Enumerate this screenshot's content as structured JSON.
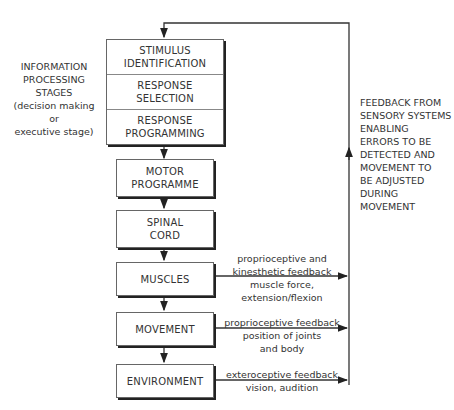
{
  "diagram": {
    "left_label": "INFORMATION\nPROCESSING\nSTAGES\n(decision making\nor\nexecutive stage)",
    "right_label": "FEEDBACK FROM\nSENSORY SYSTEMS\nENABLING\nERRORS TO BE\nDETECTED AND\nMOVEMENT TO\nBE ADJUSTED\nDURING\nMOVEMENT",
    "stages_box": [
      "STIMULUS\nIDENTIFICATION",
      "RESPONSE\nSELECTION",
      "RESPONSE\nPROGRAMMING"
    ],
    "boxes": [
      "MOTOR\nPROGRAMME",
      "SPINAL\nCORD",
      "MUSCLES",
      "MOVEMENT",
      "ENVIRONMENT"
    ],
    "feedback": {
      "muscles": "proprioceptive and\nkinesthetic feedback\nmuscle force,\nextension/flexion",
      "movement": "proprioceptive feedback\nposition of joints\nand body",
      "environment": "exteroceptive feedback\nvision, audition"
    }
  }
}
